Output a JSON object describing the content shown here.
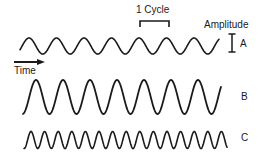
{
  "diagram": {
    "labels": {
      "cycle": "1 Cycle",
      "amplitude": "Amplitude",
      "time": "Time"
    },
    "waves": [
      {
        "id": "A",
        "label": "A",
        "x_start": 20,
        "x_end": 219,
        "center_y": 46,
        "amplitude": 8,
        "period": 27.5,
        "phase_x": 29
      },
      {
        "id": "B",
        "label": "B",
        "x_start": 23,
        "x_end": 221,
        "center_y": 97,
        "amplitude": 17,
        "period": 27,
        "phase_x": 36
      },
      {
        "id": "C",
        "label": "C",
        "x_start": 24,
        "x_end": 227,
        "center_y": 140,
        "amplitude": 8.5,
        "period": 13.6,
        "phase_x": 31
      }
    ],
    "colors": {
      "stroke": "#1a1a1a",
      "background": "#ffffff"
    }
  }
}
